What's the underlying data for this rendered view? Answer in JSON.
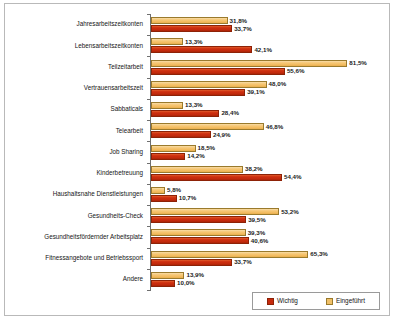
{
  "chart_data": {
    "type": "bar",
    "orientation": "horizontal",
    "title": "",
    "subtitle": "",
    "xlabel": "",
    "ylabel": "",
    "xlim": [
      0,
      90
    ],
    "grid": false,
    "legend_position": "bottom-right",
    "value_suffix": "%",
    "decimal_separator": ",",
    "categories": [
      "Jahresarbeitszeitkonten",
      "Lebensarbeitszeitkonten",
      "Teilzeitarbeit",
      "Vertrauensarbeitszeit",
      "Sabbaticals",
      "Telearbeit",
      "Job Sharing",
      "Kinderbetreuung",
      "Haushaltsnahe Dienstleistungen",
      "Gesundheits-Check",
      "Gesundheitsfördernder Arbeitsplatz",
      "Fitnessangebote und Betriebssport",
      "Andere"
    ],
    "series": [
      {
        "name": "Eingeführt",
        "color": "#F0C068",
        "values": [
          31.8,
          13.3,
          81.5,
          48.0,
          13.3,
          46.8,
          18.5,
          38.2,
          5.8,
          53.2,
          39.3,
          65.3,
          13.9
        ],
        "labels": [
          "31,8%",
          "13,3%",
          "81,5%",
          "48,0%",
          "13,3%",
          "46,8%",
          "18,5%",
          "38,2%",
          "5,8%",
          "53,2%",
          "39,3%",
          "65,3%",
          "13,9%"
        ]
      },
      {
        "name": "Wichtig",
        "color": "#C62A0D",
        "values": [
          33.7,
          42.1,
          55.6,
          39.1,
          28.4,
          24.9,
          14.2,
          54.4,
          10.7,
          39.5,
          40.6,
          33.7,
          10.0
        ],
        "labels": [
          "33,7%",
          "42,1%",
          "55,6%",
          "39,1%",
          "28,4%",
          "24,9%",
          "14,2%",
          "54,4%",
          "10,7%",
          "39,5%",
          "40,6%",
          "33,7%",
          "10,0%"
        ]
      }
    ]
  },
  "legend": {
    "items": [
      {
        "label": "Wichtig",
        "color": "#C62A0D"
      },
      {
        "label": "Eingeführt",
        "color": "#F0C068"
      }
    ]
  }
}
